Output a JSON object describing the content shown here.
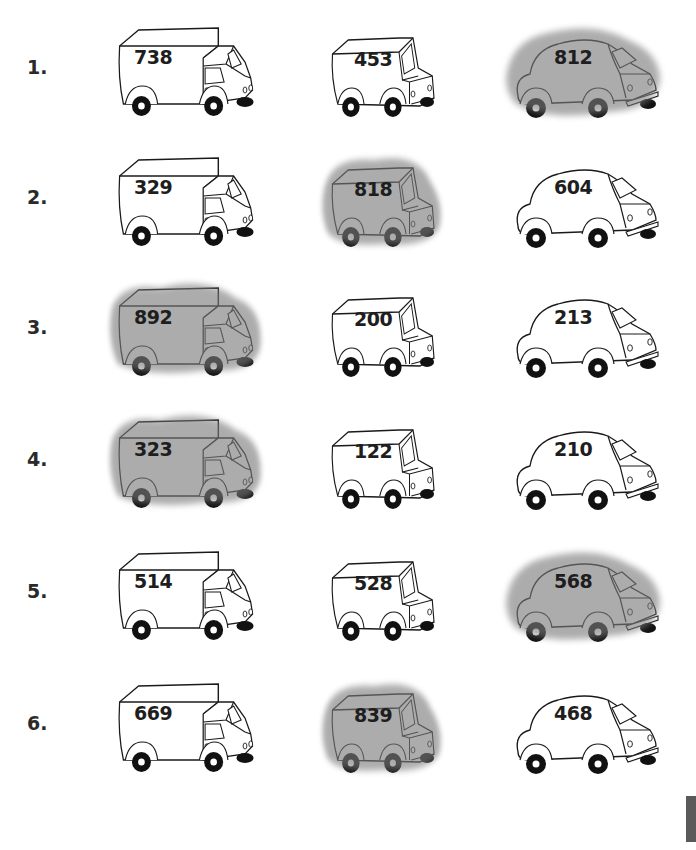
{
  "worksheet": {
    "rows": [
      {
        "label": "1.",
        "truck": {
          "number": "738",
          "shaded": false
        },
        "van": {
          "number": "453",
          "shaded": false
        },
        "car": {
          "number": "812",
          "shaded": true
        }
      },
      {
        "label": "2.",
        "truck": {
          "number": "329",
          "shaded": false
        },
        "van": {
          "number": "818",
          "shaded": true
        },
        "car": {
          "number": "604",
          "shaded": false
        }
      },
      {
        "label": "3.",
        "truck": {
          "number": "892",
          "shaded": true
        },
        "van": {
          "number": "200",
          "shaded": false
        },
        "car": {
          "number": "213",
          "shaded": false
        }
      },
      {
        "label": "4.",
        "truck": {
          "number": "323",
          "shaded": true
        },
        "van": {
          "number": "122",
          "shaded": false
        },
        "car": {
          "number": "210",
          "shaded": false
        }
      },
      {
        "label": "5.",
        "truck": {
          "number": "514",
          "shaded": false
        },
        "van": {
          "number": "528",
          "shaded": false
        },
        "car": {
          "number": "568",
          "shaded": true
        }
      },
      {
        "label": "6.",
        "truck": {
          "number": "669",
          "shaded": false
        },
        "van": {
          "number": "839",
          "shaded": true
        },
        "car": {
          "number": "468",
          "shaded": false
        }
      }
    ]
  },
  "colors": {
    "shade": "#7a7a7a",
    "outline": "#1a1a1a",
    "tab": "#5a5a5a"
  }
}
